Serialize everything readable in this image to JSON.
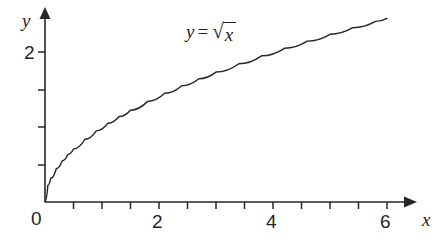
{
  "chart_data": {
    "type": "line",
    "title": "",
    "subtitle": "",
    "xlabel": "x",
    "ylabel": "y",
    "function": "y = sqrt(x)",
    "annotation": {
      "text": "y = √x",
      "lhs": "y",
      "operator": "=",
      "radical_sign": "√",
      "radicand": "x"
    },
    "xlim": [
      0,
      6.3
    ],
    "ylim": [
      0,
      2.55
    ],
    "grid": false,
    "legend": null,
    "x_ticks_major": [
      0,
      2,
      4,
      6
    ],
    "x_tick_labels": [
      "0",
      "2",
      "4",
      "6"
    ],
    "x_ticks_minor": [
      0.5,
      1,
      1.5,
      2.5,
      3,
      3.5,
      4.5,
      5,
      5.5,
      6.3
    ],
    "y_ticks_major": [
      2
    ],
    "y_tick_labels": [
      "2"
    ],
    "y_ticks_minor": [
      0.5,
      1,
      1.5,
      2.5
    ],
    "series": [
      {
        "name": "y = sqrt(x)",
        "color": "#262626",
        "x": [
          0,
          0.05,
          0.1,
          0.2,
          0.3,
          0.4,
          0.5,
          0.7,
          0.9,
          1.1,
          1.3,
          1.5,
          1.8,
          2.1,
          2.4,
          2.7,
          3.0,
          3.4,
          3.8,
          4.2,
          4.6,
          5.0,
          5.4,
          5.8,
          6.0
        ],
        "y": [
          0,
          0.2236,
          0.3162,
          0.4472,
          0.5477,
          0.6325,
          0.7071,
          0.8367,
          0.9487,
          1.0488,
          1.1402,
          1.2247,
          1.3416,
          1.4491,
          1.5492,
          1.6432,
          1.7321,
          1.8439,
          1.9494,
          2.0494,
          2.1448,
          2.2361,
          2.3238,
          2.4083,
          2.4495
        ]
      }
    ]
  },
  "axes": {
    "x_axis_label": "x",
    "y_axis_label": "y",
    "origin_label": "0"
  }
}
